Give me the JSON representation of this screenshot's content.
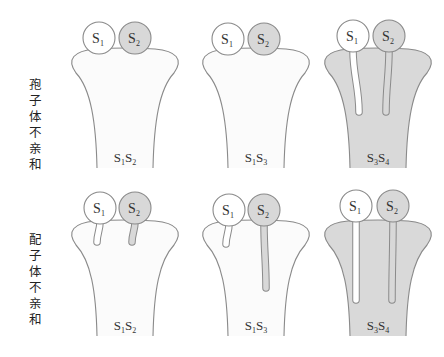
{
  "colors": {
    "outline": "#8a8a8a",
    "pollen_s1": "#ffffff",
    "pollen_s2": "#d8d8d8",
    "pistil_compatible": "#fbfbfb",
    "pistil_incompatible": "#d9d9d9",
    "tube_s1": "#ffffff",
    "tube_s2": "#d8d8d8"
  },
  "rows": [
    {
      "label": "孢子体不亲和",
      "label_chars": [
        "孢",
        "子",
        "体",
        "不",
        "亲",
        "和"
      ],
      "label_top": 77,
      "pistil_top": 49,
      "pistil_bottom": 168,
      "panels": [
        {
          "cx": 125,
          "genotype": "S1S2",
          "genotype_a": "S",
          "sub_a": "1",
          "genotype_b": "S",
          "sub_b": "2",
          "pistil_fill": "pistil_compatible",
          "pollen": [
            {
              "allele": "S",
              "sub": "1",
              "cx": 99,
              "cy": 38,
              "fill": "pollen_s1",
              "tube": null
            },
            {
              "allele": "S",
              "sub": "2",
              "cx": 135,
              "cy": 38,
              "fill": "pollen_s2",
              "tube": null
            }
          ]
        },
        {
          "cx": 256,
          "genotype": "S1S3",
          "genotype_a": "S",
          "sub_a": "1",
          "genotype_b": "S",
          "sub_b": "3",
          "pistil_fill": "pistil_compatible",
          "pollen": [
            {
              "allele": "S",
              "sub": "1",
              "cx": 228,
              "cy": 39,
              "fill": "pollen_s1",
              "tube": null
            },
            {
              "allele": "S",
              "sub": "2",
              "cx": 264,
              "cy": 39,
              "fill": "pollen_s2",
              "tube": null
            }
          ]
        },
        {
          "cx": 378,
          "genotype": "S3S4",
          "genotype_a": "S",
          "sub_a": "3",
          "genotype_b": "S",
          "sub_b": "4",
          "pistil_fill": "pistil_incompatible",
          "pollen": [
            {
              "allele": "S",
              "sub": "1",
              "cx": 353,
              "cy": 36,
              "fill": "pollen_s1",
              "tube": {
                "len": 62,
                "bend": 6
              }
            },
            {
              "allele": "S",
              "sub": "2",
              "cx": 389,
              "cy": 36,
              "fill": "pollen_s2",
              "tube": {
                "len": 62,
                "bend": -3
              }
            }
          ]
        }
      ]
    },
    {
      "label": "配子体不亲和",
      "label_chars": [
        "配",
        "子",
        "体",
        "不",
        "亲",
        "和"
      ],
      "label_top": 232,
      "pistil_top": 221,
      "pistil_bottom": 336,
      "panels": [
        {
          "cx": 125,
          "genotype": "S1S2",
          "genotype_a": "S",
          "sub_a": "1",
          "genotype_b": "S",
          "sub_b": "2",
          "pistil_fill": "pistil_compatible",
          "pollen": [
            {
              "allele": "S",
              "sub": "1",
              "cx": 100,
              "cy": 208,
              "fill": "pollen_s1",
              "tube": {
                "len": 20,
                "bend": -3
              }
            },
            {
              "allele": "S",
              "sub": "2",
              "cx": 135,
              "cy": 208,
              "fill": "pollen_s2",
              "tube": {
                "len": 20,
                "bend": -3
              }
            }
          ]
        },
        {
          "cx": 256,
          "genotype": "S1S3",
          "genotype_a": "S",
          "sub_a": "1",
          "genotype_b": "S",
          "sub_b": "3",
          "pistil_fill": "pistil_compatible",
          "pollen": [
            {
              "allele": "S",
              "sub": "1",
              "cx": 229,
              "cy": 210,
              "fill": "pollen_s1",
              "tube": {
                "len": 20,
                "bend": -3
              }
            },
            {
              "allele": "S",
              "sub": "2",
              "cx": 264,
              "cy": 210,
              "fill": "pollen_s2",
              "tube": {
                "len": 64,
                "bend": 2
              }
            }
          ]
        },
        {
          "cx": 378,
          "genotype": "S3S4",
          "genotype_a": "S",
          "sub_a": "3",
          "genotype_b": "S",
          "sub_b": "4",
          "pistil_fill": "pistil_incompatible",
          "pollen": [
            {
              "allele": "S",
              "sub": "1",
              "cx": 356,
              "cy": 206,
              "fill": "pollen_s1",
              "tube": {
                "len": 80,
                "bend": 0
              }
            },
            {
              "allele": "S",
              "sub": "2",
              "cx": 393,
              "cy": 206,
              "fill": "pollen_s2",
              "tube": {
                "len": 80,
                "bend": -1
              }
            }
          ]
        }
      ]
    }
  ]
}
